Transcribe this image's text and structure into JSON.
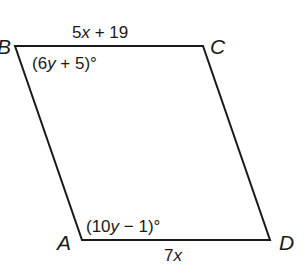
{
  "figure": {
    "type": "parallelogram",
    "stroke_color": "#1a1a1a",
    "background": "#ffffff",
    "vertices": [
      {
        "name": "B",
        "x": 15,
        "y": 46
      },
      {
        "name": "C",
        "x": 203,
        "y": 46
      },
      {
        "name": "D",
        "x": 270,
        "y": 240
      },
      {
        "name": "A",
        "x": 82,
        "y": 240
      }
    ]
  },
  "labels": {
    "vertex_A": "A",
    "vertex_B": "B",
    "vertex_C": "C",
    "vertex_D": "D"
  },
  "sides": {
    "BC": {
      "coef": "5",
      "var": "x",
      "rest": " + 19",
      "full": "5x + 19"
    },
    "AD": {
      "coef": "7",
      "var": "x",
      "rest": "",
      "full": "7x"
    }
  },
  "angles": {
    "B": {
      "open": "(6",
      "var": "y",
      "rest": " + 5)°",
      "full": "(6y + 5)°"
    },
    "A": {
      "open": "(10",
      "var": "y",
      "rest": " − 1)°",
      "full": "(10y − 1)°"
    }
  }
}
